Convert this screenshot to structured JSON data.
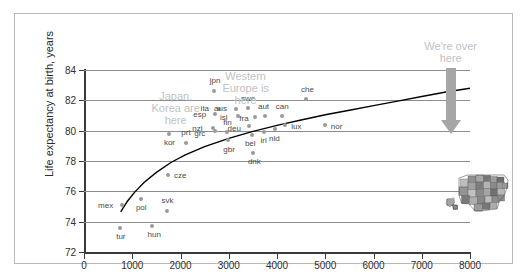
{
  "chart_data": {
    "type": "scatter",
    "title": "",
    "xlabel": "",
    "ylabel": "Life expectancy at birth, years",
    "xlim": [
      0,
      8000
    ],
    "ylim": [
      72,
      84
    ],
    "xticks": [
      0,
      1000,
      2000,
      3000,
      4000,
      5000,
      6000,
      7000,
      8000
    ],
    "yticks": [
      72,
      74,
      76,
      78,
      80,
      82,
      84
    ],
    "grid": "horizontal",
    "legend": "none",
    "marker_color": "#9a9a9a",
    "label_color": "#4a4a4a",
    "annotation_color": "#c2c2c2",
    "trend_color": "#000000",
    "points": [
      {
        "label": "tur",
        "x": 750,
        "y": 73.6,
        "lx": -4,
        "ly": 10
      },
      {
        "label": "mex",
        "x": 790,
        "y": 75.1,
        "lx": -24,
        "ly": 2
      },
      {
        "label": "hun",
        "x": 1400,
        "y": 73.7,
        "lx": -4,
        "ly": 10
      },
      {
        "label": "pol",
        "x": 1180,
        "y": 75.5,
        "lx": -5,
        "ly": 10
      },
      {
        "label": "svk",
        "x": 1710,
        "y": 74.7,
        "lx": -5,
        "ly": -9
      },
      {
        "label": "cze",
        "x": 1740,
        "y": 77.1,
        "lx": 6,
        "ly": 2
      },
      {
        "label": "kor",
        "x": 1760,
        "y": 79.8,
        "lx": -5,
        "ly": 10
      },
      {
        "label": "prt",
        "x": 2120,
        "y": 79.2,
        "lx": -5,
        "ly": -9
      },
      {
        "label": "jpn",
        "x": 2690,
        "y": 82.6,
        "lx": -4,
        "ly": -9
      },
      {
        "label": "esp",
        "x": 2720,
        "y": 81.1,
        "lx": -22,
        "ly": 2
      },
      {
        "label": "ita",
        "x": 2790,
        "y": 81.4,
        "lx": -18,
        "ly": 1
      },
      {
        "label": "nzl",
        "x": 2680,
        "y": 80.2,
        "lx": -21,
        "ly": 2
      },
      {
        "label": "grc",
        "x": 2720,
        "y": 80.0,
        "lx": -21,
        "ly": 4
      },
      {
        "label": "fin",
        "x": 2970,
        "y": 79.9,
        "lx": -4,
        "ly": -8
      },
      {
        "label": "gbr",
        "x": 2990,
        "y": 79.4,
        "lx": -5,
        "ly": 11
      },
      {
        "label": "aus",
        "x": 3150,
        "y": 81.4,
        "lx": -22,
        "ly": 1
      },
      {
        "label": "isl",
        "x": 3190,
        "y": 81.0,
        "lx": -18,
        "ly": 3
      },
      {
        "label": "swe",
        "x": 3400,
        "y": 81.5,
        "lx": -7,
        "ly": -8
      },
      {
        "label": "dnk",
        "x": 3500,
        "y": 78.5,
        "lx": -5,
        "ly": 10
      },
      {
        "label": "bel",
        "x": 3480,
        "y": 79.7,
        "lx": -7,
        "ly": 10
      },
      {
        "label": "deu",
        "x": 3430,
        "y": 80.3,
        "lx": -22,
        "ly": 4
      },
      {
        "label": "fra",
        "x": 3550,
        "y": 80.9,
        "lx": -16,
        "ly": 3
      },
      {
        "label": "irl",
        "x": 3740,
        "y": 79.9,
        "lx": -4,
        "ly": 10
      },
      {
        "label": "aut",
        "x": 3750,
        "y": 81.0,
        "lx": -7,
        "ly": -8
      },
      {
        "label": "nld",
        "x": 3960,
        "y": 80.1,
        "lx": -6,
        "ly": 11
      },
      {
        "label": "can",
        "x": 4100,
        "y": 81.0,
        "lx": -6,
        "ly": -8
      },
      {
        "label": "lux",
        "x": 4170,
        "y": 80.4,
        "lx": 6,
        "ly": 3
      },
      {
        "label": "che",
        "x": 4600,
        "y": 82.1,
        "lx": -5,
        "ly": -8
      },
      {
        "label": "nor",
        "x": 4990,
        "y": 80.4,
        "lx": 6,
        "ly": 3
      }
    ],
    "trend_curve": [
      {
        "x": 760,
        "y": 74.65
      },
      {
        "x": 900,
        "y": 75.35
      },
      {
        "x": 1050,
        "y": 75.95
      },
      {
        "x": 1250,
        "y": 76.6
      },
      {
        "x": 1500,
        "y": 77.25
      },
      {
        "x": 1800,
        "y": 77.9
      },
      {
        "x": 2100,
        "y": 78.4
      },
      {
        "x": 2500,
        "y": 78.95
      },
      {
        "x": 3000,
        "y": 79.5
      },
      {
        "x": 3500,
        "y": 79.95
      },
      {
        "x": 4000,
        "y": 80.35
      },
      {
        "x": 4500,
        "y": 80.7
      },
      {
        "x": 5000,
        "y": 81.05
      },
      {
        "x": 5500,
        "y": 81.35
      },
      {
        "x": 6000,
        "y": 81.65
      },
      {
        "x": 6500,
        "y": 81.95
      },
      {
        "x": 7000,
        "y": 82.25
      },
      {
        "x": 7500,
        "y": 82.55
      },
      {
        "x": 8000,
        "y": 82.8
      }
    ],
    "annotations": [
      {
        "name": "japan-korea",
        "text": "Japan,\nKorea are\nhere",
        "x": 1900,
        "y": 82.3
      },
      {
        "name": "western-europe",
        "text": "Western\nEurope is\nhere",
        "x": 3350,
        "y": 83.6
      },
      {
        "name": "were-over-here",
        "text": "We're over\nhere",
        "x": 7600,
        "y": 85.6
      }
    ],
    "arrow": {
      "name": "us-pointer-arrow",
      "x": 7600,
      "y_top": 84.1,
      "y_bottom": 79.9,
      "color": "#a6a6a6"
    },
    "image_inset": {
      "name": "united-states-map",
      "description": "grayscale map of the United States"
    }
  }
}
